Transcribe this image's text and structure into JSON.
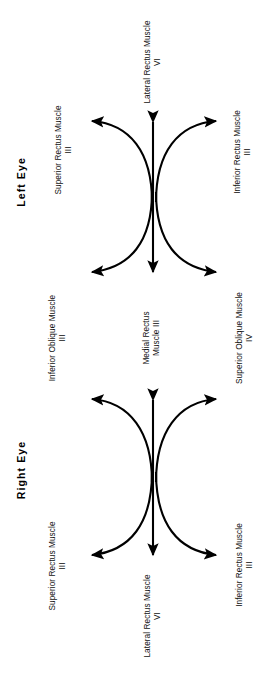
{
  "figure": {
    "type": "medical-diagram",
    "stroke_color": "#000000",
    "text_color": "#111111",
    "background": "#ffffff"
  },
  "eyes": [
    {
      "id": "left-eye",
      "title": "Left Eye",
      "labels": {
        "center_axis": {
          "top": {
            "muscle": "Lateral Rectus Muscle",
            "nerve": "VI"
          },
          "bottom": {
            "muscle_line1": "Medial Rectus",
            "muscle_line2": "Muscle III",
            "nerve": ""
          }
        },
        "upper_left": {
          "muscle": "Superior Rectus Muscle",
          "nerve": "III"
        },
        "upper_right": {
          "muscle": "Inferior Rectus Muscle",
          "nerve": "III"
        },
        "lower_left": {
          "muscle": "Inferior Oblique Muscle",
          "nerve": "III"
        },
        "lower_right": {
          "muscle": "Superior Oblique Muscle",
          "nerve": "IV"
        }
      }
    },
    {
      "id": "right-eye",
      "title": "Right Eye",
      "labels": {
        "center_axis": {
          "top": {
            "muscle_line1": "Medial Rectus",
            "muscle_line2": "Muscle III",
            "nerve": ""
          },
          "bottom": {
            "muscle": "Lateral Rectus Muscle",
            "nerve": "VI"
          }
        },
        "upper_left": {
          "muscle": "Inferior Oblique Muscle",
          "nerve": "III"
        },
        "upper_right": {
          "muscle": "Superior Oblique Muscle",
          "nerve": "IV"
        },
        "lower_left": {
          "muscle": "Superior Rectus Muscle",
          "nerve": "III"
        },
        "lower_right": {
          "muscle": "Inferior Rectus Muscle",
          "nerve": "III"
        }
      }
    }
  ],
  "shared_middle_labels": {
    "left": {
      "muscle": "Inferior Oblique Muscle",
      "nerve": "III"
    },
    "center": {
      "muscle_line1": "Medial Rectus",
      "muscle_line2": "Muscle III"
    },
    "right": {
      "muscle": "Superior Oblique Muscle",
      "nerve": "IV"
    }
  },
  "top_label": {
    "muscle": "Lateral Rectus Muscle",
    "nerve": "VI"
  },
  "bottom_label": {
    "muscle": "Lateral Rectus Muscle",
    "nerve": "VI"
  },
  "left_eye_upper_left": {
    "muscle": "Superior Rectus Muscle",
    "nerve": "III"
  },
  "left_eye_upper_right": {
    "muscle": "Inferior Rectus Muscle",
    "nerve": "III"
  },
  "right_eye_lower_left": {
    "muscle": "Superior Rectus Muscle",
    "nerve": "III"
  },
  "right_eye_lower_right": {
    "muscle": "Inferior Rectus Muscle",
    "nerve": "III"
  },
  "titles": {
    "left_eye": "Left Eye",
    "right_eye": "Right Eye"
  }
}
